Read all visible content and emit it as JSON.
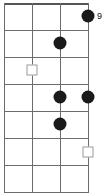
{
  "diagram": {
    "kind": "fretboard-chord-diagram",
    "instrument_strings": 4,
    "fret_count": 6,
    "position_label": "9",
    "colors": {
      "background": "#ffffff",
      "grid_line": "#6b6b6b",
      "nut_line": "#555555",
      "dot_fill": "#1a1a1a",
      "square_fill": "#ffffff",
      "square_stroke": "#9a9a9a",
      "label_text": "#111111"
    },
    "geometry": {
      "width": 108,
      "height": 196,
      "string_x": [
        4,
        32,
        60,
        88
      ],
      "fret_y": [
        3,
        30,
        57,
        84,
        111,
        138,
        165,
        192
      ]
    },
    "strings": [
      {
        "index": 1,
        "x": 4
      },
      {
        "index": 2,
        "x": 32
      },
      {
        "index": 3,
        "x": 60
      },
      {
        "index": 4,
        "x": 88
      }
    ],
    "frets": [
      {
        "index": 0,
        "y": 3,
        "is_nut": true
      },
      {
        "index": 1,
        "y": 30,
        "is_nut": false
      },
      {
        "index": 2,
        "y": 57,
        "is_nut": false
      },
      {
        "index": 3,
        "y": 84,
        "is_nut": false
      },
      {
        "index": 4,
        "y": 111,
        "is_nut": false
      },
      {
        "index": 5,
        "y": 138,
        "is_nut": false
      },
      {
        "index": 6,
        "y": 165,
        "is_nut": false
      },
      {
        "index": 7,
        "y": 192,
        "is_nut": false
      }
    ],
    "markers": [
      {
        "id": "m1",
        "type": "dot",
        "string": 4,
        "fret": 1,
        "x": 88,
        "y": 16
      },
      {
        "id": "m2",
        "type": "dot",
        "string": 3,
        "fret": 2,
        "x": 60,
        "y": 43
      },
      {
        "id": "m3",
        "type": "square",
        "string": 2,
        "fret": 3,
        "x": 32,
        "y": 70
      },
      {
        "id": "m4",
        "type": "dot",
        "string": 3,
        "fret": 4,
        "x": 60,
        "y": 97
      },
      {
        "id": "m5",
        "type": "dot",
        "string": 4,
        "fret": 4,
        "x": 88,
        "y": 97
      },
      {
        "id": "m6",
        "type": "dot",
        "string": 3,
        "fret": 5,
        "x": 60,
        "y": 124
      },
      {
        "id": "m7",
        "type": "square",
        "string": 4,
        "fret": 6,
        "x": 88,
        "y": 152
      }
    ],
    "label_position": {
      "x": 97,
      "y": 17
    }
  }
}
